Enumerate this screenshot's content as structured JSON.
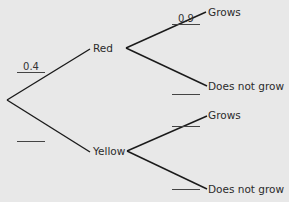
{
  "diagram": {
    "type": "probability-tree",
    "root": "start",
    "stage1": {
      "branches": [
        {
          "label": "Red",
          "probability": "0.4"
        },
        {
          "label": "Yellow",
          "probability": ""
        }
      ]
    },
    "stage2": {
      "red": {
        "branches": [
          {
            "label": "Grows",
            "probability": "0.9"
          },
          {
            "label": "Does not grow",
            "probability": ""
          }
        ]
      },
      "yellow": {
        "branches": [
          {
            "label": "Grows",
            "probability": ""
          },
          {
            "label": "Does not grow",
            "probability": ""
          }
        ]
      }
    },
    "colors": {
      "background": "#e8e8e8",
      "lines": "#1a1a1a",
      "text": "#2b2b2b"
    }
  }
}
